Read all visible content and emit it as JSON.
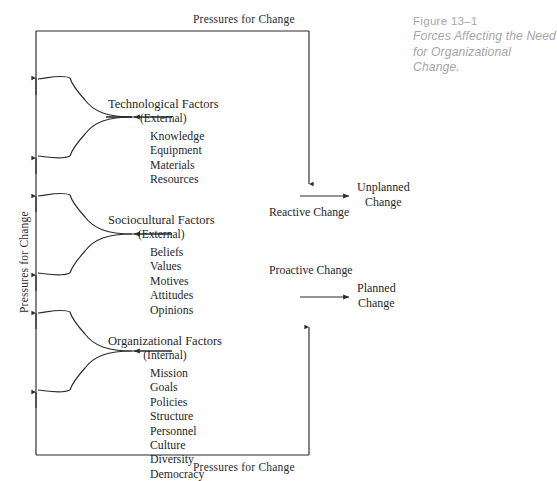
{
  "figure": {
    "caption_number": "Figure 13–1",
    "caption_title": "Forces Affecting the Need for Organizational Change."
  },
  "labels": {
    "pressure_top": "Pressures for Change",
    "pressure_bottom": "Pressures for Change",
    "pressure_left": "Pressures for Change"
  },
  "factors": [
    {
      "id": "technological",
      "title": "Technological Factors",
      "scope": "(External)",
      "items": [
        "Knowledge",
        "Equipment",
        "Materials",
        "Resources"
      ]
    },
    {
      "id": "sociocultural",
      "title": "Sociocultural Factors",
      "scope": "(External)",
      "items": [
        "Beliefs",
        "Values",
        "Motives",
        "Attitudes",
        "Opinions"
      ]
    },
    {
      "id": "organizational",
      "title": "Organizational Factors",
      "scope": "(Internal)",
      "items": [
        "Mission",
        "Goals",
        "Policies",
        "Structure",
        "Personnel",
        "Culture",
        "Diversity",
        "Democracy"
      ]
    }
  ],
  "changes": [
    {
      "id": "reactive",
      "type_label": "Reactive Change",
      "outcome_line1": "Unplanned",
      "outcome_line2": "Change"
    },
    {
      "id": "proactive",
      "type_label": "Proactive Change",
      "outcome_line1": "Planned",
      "outcome_line2": "Change"
    }
  ],
  "colors": {
    "line": "#2b2b2b",
    "text": "#1f1f1f",
    "caption": "#a6a6a6",
    "background": "#ffffff"
  }
}
